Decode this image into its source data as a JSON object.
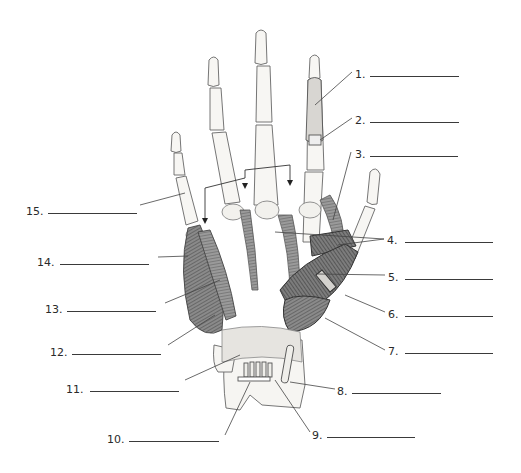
{
  "diagram": {
    "colors": {
      "bone": "#f4f2ee",
      "muscle": "#7a7a7a",
      "muscle_dark": "#555555",
      "outline": "#555555",
      "leader": "#444444",
      "background": "#ffffff"
    },
    "labels": [
      {
        "num": "1.",
        "x": 355,
        "y": 69,
        "line_x": 370,
        "line_w": 89
      },
      {
        "num": "2.",
        "x": 355,
        "y": 115,
        "line_x": 370,
        "line_w": 89
      },
      {
        "num": "3.",
        "x": 355,
        "y": 149,
        "line_x": 370,
        "line_w": 88
      },
      {
        "num": "4.",
        "x": 387,
        "y": 235,
        "line_x": 405,
        "line_w": 88
      },
      {
        "num": "5.",
        "x": 388,
        "y": 272,
        "line_x": 405,
        "line_w": 88
      },
      {
        "num": "6.",
        "x": 388,
        "y": 309,
        "line_x": 405,
        "line_w": 88
      },
      {
        "num": "7.",
        "x": 388,
        "y": 346,
        "line_x": 405,
        "line_w": 88
      },
      {
        "num": "8.",
        "x": 337,
        "y": 386,
        "line_x": 352,
        "line_w": 89
      },
      {
        "num": "9.",
        "x": 312,
        "y": 430,
        "line_x": 327,
        "line_w": 88
      },
      {
        "num": "10.",
        "x": 107,
        "y": 434,
        "line_x": 129,
        "line_w": 90
      },
      {
        "num": "11.",
        "x": 66,
        "y": 384,
        "line_x": 90,
        "line_w": 89
      },
      {
        "num": "12.",
        "x": 50,
        "y": 347,
        "line_x": 72,
        "line_w": 89
      },
      {
        "num": "13.",
        "x": 45,
        "y": 304,
        "line_x": 67,
        "line_w": 89
      },
      {
        "num": "14.",
        "x": 37,
        "y": 257,
        "line_x": 60,
        "line_w": 89
      },
      {
        "num": "15.",
        "x": 26,
        "y": 206,
        "line_x": 48,
        "line_w": 89
      }
    ],
    "answers_visible": false
  }
}
